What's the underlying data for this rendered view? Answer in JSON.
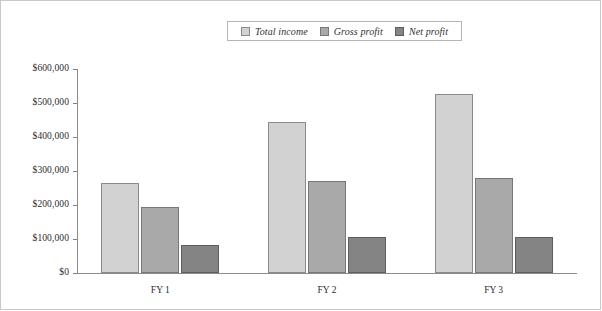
{
  "chart_data": {
    "type": "bar",
    "title": "",
    "xlabel": "",
    "ylabel": "",
    "categories": [
      "FY 1",
      "FY 2",
      "FY 3"
    ],
    "series": [
      {
        "name": "Total income",
        "values": [
          265000,
          445000,
          527000
        ],
        "color": "#d2d2d2",
        "border_color": "#8a8a8a"
      },
      {
        "name": "Gross profit",
        "values": [
          195000,
          270000,
          280000
        ],
        "color": "#a9a9a9",
        "border_color": "#777777"
      },
      {
        "name": "Net profit",
        "values": [
          83000,
          105000,
          105000
        ],
        "color": "#848484",
        "border_color": "#5e5e5e"
      }
    ],
    "ylim": [
      0,
      600000
    ],
    "y_ticks": [
      0,
      100000,
      200000,
      300000,
      400000,
      500000,
      600000
    ],
    "y_tick_labels": [
      "$0",
      "$100,000",
      "$200,000",
      "$300,000",
      "$400,000",
      "$500,000",
      "$600,000"
    ],
    "grid": false,
    "legend_position": "top-center"
  },
  "legend": {
    "items": [
      {
        "label": "Total income"
      },
      {
        "label": "Gross profit"
      },
      {
        "label": "Net profit"
      }
    ]
  }
}
